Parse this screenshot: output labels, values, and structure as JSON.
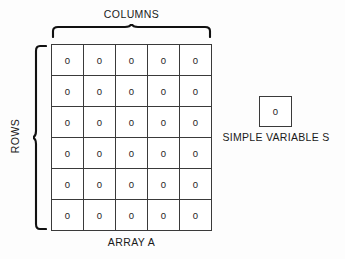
{
  "diagram": {
    "labels": {
      "columns": "COLUMNS",
      "rows": "ROWS",
      "array": "ARRAY A",
      "simple_variable": "SIMPLE VARIABLE S"
    },
    "array": {
      "rows": 6,
      "cols": 5,
      "cell_value": "0",
      "values": [
        [
          "0",
          "0",
          "0",
          "0",
          "0"
        ],
        [
          "0",
          "0",
          "0",
          "0",
          "0"
        ],
        [
          "0",
          "0",
          "0",
          "0",
          "0"
        ],
        [
          "0",
          "0",
          "0",
          "0",
          "0"
        ],
        [
          "0",
          "0",
          "0",
          "0",
          "0"
        ],
        [
          "0",
          "0",
          "0",
          "0",
          "0"
        ]
      ]
    },
    "simple_variable": {
      "value": "0"
    },
    "colors": {
      "background": "#fdfdfd",
      "cell_background": "#ffffff",
      "border": "#3a3a3a",
      "text": "#1a1a1a",
      "brace": "#111111"
    }
  }
}
